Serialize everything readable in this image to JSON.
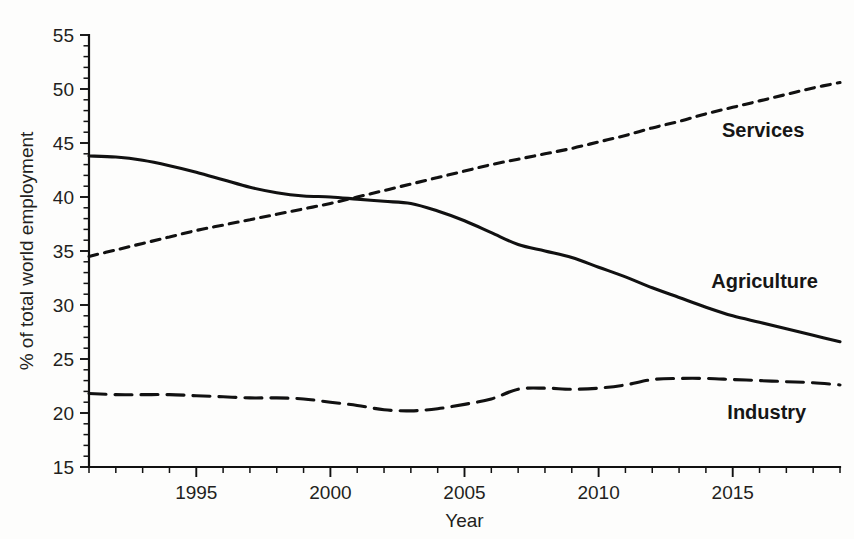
{
  "chart_data": {
    "type": "line",
    "title": "",
    "xlabel": "Year",
    "ylabel": "% of total world employment",
    "xlim": [
      1991,
      2019
    ],
    "ylim": [
      15,
      55
    ],
    "ytick_step": 5,
    "yminor_step": 1,
    "xtick_step": 1,
    "xlabel_step": 5,
    "grid": false,
    "legend_position": "inline-right",
    "x": [
      1991,
      1992,
      1993,
      1994,
      1995,
      1996,
      1997,
      1998,
      1999,
      2000,
      2001,
      2002,
      2003,
      2004,
      2005,
      2006,
      2007,
      2008,
      2009,
      2010,
      2011,
      2012,
      2013,
      2014,
      2015,
      2016,
      2017,
      2018,
      2019
    ],
    "xticks": [
      1991,
      1992,
      1993,
      1994,
      1995,
      1996,
      1997,
      1998,
      1999,
      2000,
      2001,
      2002,
      2003,
      2004,
      2005,
      2006,
      2007,
      2008,
      2009,
      2010,
      2011,
      2012,
      2013,
      2014,
      2015,
      2016,
      2017,
      2018,
      2019
    ],
    "xtick_labels": [
      "1995",
      "2000",
      "2005",
      "2010",
      "2015"
    ],
    "xtick_label_values": [
      1995,
      2000,
      2005,
      2010,
      2015
    ],
    "yticks": [
      15,
      20,
      25,
      30,
      35,
      40,
      45,
      50,
      55
    ],
    "ytick_labels": [
      "15",
      "20",
      "25",
      "30",
      "35",
      "40",
      "45",
      "50",
      "55"
    ],
    "series": [
      {
        "name": "Agriculture",
        "style": "solid",
        "label_x": 2014.2,
        "label_y": 31.6,
        "values": [
          43.8,
          43.7,
          43.4,
          42.9,
          42.3,
          41.6,
          40.9,
          40.4,
          40.1,
          40.0,
          39.8,
          39.6,
          39.4,
          38.7,
          37.8,
          36.7,
          35.6,
          35.0,
          34.4,
          33.5,
          32.6,
          31.6,
          30.7,
          29.8,
          29.0,
          28.4,
          27.8,
          27.2,
          26.6
        ]
      },
      {
        "name": "Services",
        "style": "dashed-short",
        "label_x": 2014.6,
        "label_y": 45.6,
        "values": [
          34.5,
          35.1,
          35.7,
          36.3,
          36.9,
          37.4,
          37.9,
          38.4,
          38.9,
          39.4,
          40.0,
          40.6,
          41.2,
          41.8,
          42.4,
          43.0,
          43.5,
          44.0,
          44.5,
          45.1,
          45.7,
          46.4,
          47.0,
          47.7,
          48.3,
          48.9,
          49.5,
          50.1,
          50.6
        ]
      },
      {
        "name": "Industry",
        "style": "dashed-long",
        "label_x": 2014.8,
        "label_y": 19.4,
        "values": [
          21.8,
          21.7,
          21.7,
          21.7,
          21.6,
          21.5,
          21.4,
          21.4,
          21.3,
          21.0,
          20.7,
          20.3,
          20.2,
          20.4,
          20.8,
          21.3,
          22.2,
          22.3,
          22.2,
          22.3,
          22.6,
          23.1,
          23.2,
          23.2,
          23.1,
          23.0,
          22.9,
          22.8,
          22.6
        ]
      }
    ]
  }
}
